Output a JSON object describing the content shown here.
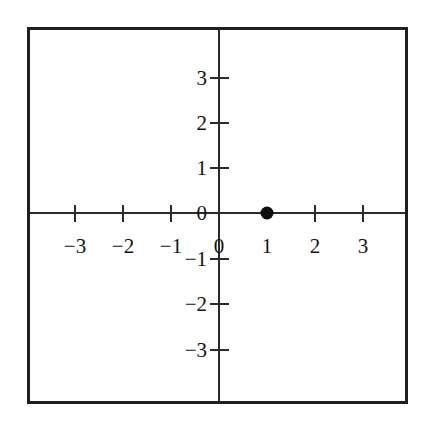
{
  "chart_data": {
    "type": "scatter",
    "title": "",
    "xlabel": "",
    "ylabel": "",
    "xlim": [
      -4,
      4
    ],
    "ylim": [
      -4,
      4
    ],
    "grid": false,
    "legend": null,
    "x_ticks": [
      -3,
      -2,
      -1,
      0,
      1,
      2,
      3
    ],
    "y_ticks": [
      -3,
      -2,
      -1,
      0,
      1,
      2,
      3
    ],
    "x_tick_labels": [
      "−3",
      "−2",
      "−1",
      "0",
      "1",
      "2",
      "3"
    ],
    "y_tick_labels": [
      "−3",
      "−2",
      "−1",
      "0",
      "1",
      "2",
      "3"
    ],
    "points": [
      {
        "label": "(1, 0)",
        "x": 1,
        "y": 0
      }
    ],
    "point_color": "#0d0d0d",
    "axis_color": "#2a2a2a",
    "frame_color": "#1f1f1f",
    "background_color": "#ffffff"
  },
  "axes": {
    "x_ticks": [
      {
        "value": -3,
        "label": "−3",
        "px": 75,
        "has_tick": true,
        "has_label": true
      },
      {
        "value": -2,
        "label": "−2",
        "px": 123,
        "has_tick": true,
        "has_label": true
      },
      {
        "value": -1,
        "label": "−1",
        "px": 171,
        "has_tick": true,
        "has_label": true
      },
      {
        "value": 0,
        "label": "0",
        "px": 219,
        "has_tick": false,
        "has_label": true
      },
      {
        "value": 1,
        "label": "1",
        "px": 267,
        "has_tick": false,
        "has_label": true
      },
      {
        "value": 2,
        "label": "2",
        "px": 315,
        "has_tick": true,
        "has_label": true
      },
      {
        "value": 3,
        "label": "3",
        "px": 363,
        "has_tick": true,
        "has_label": true
      }
    ],
    "y_ticks": [
      {
        "value": 3,
        "label": "3",
        "px": 78,
        "has_tick": true,
        "has_label": true
      },
      {
        "value": 2,
        "label": "2",
        "px": 123,
        "has_tick": true,
        "has_label": true
      },
      {
        "value": 1,
        "label": "1",
        "px": 168,
        "has_tick": true,
        "has_label": true
      },
      {
        "value": 0,
        "label": "0",
        "px": 213,
        "has_tick": false,
        "has_label": true
      },
      {
        "value": -1,
        "label": "−1",
        "px": 259,
        "has_tick": true,
        "has_label": true
      },
      {
        "value": -2,
        "label": "−2",
        "px": 304,
        "has_tick": true,
        "has_label": true
      },
      {
        "value": -3,
        "label": "−3",
        "px": 350,
        "has_tick": true,
        "has_label": true
      }
    ]
  },
  "geometry": {
    "origin_x_px": 219,
    "origin_y_px": 213,
    "x_unit_px": 48,
    "y_unit_px": 45,
    "x_label_baseline_px": 236,
    "y_label_offset_px": 12
  }
}
